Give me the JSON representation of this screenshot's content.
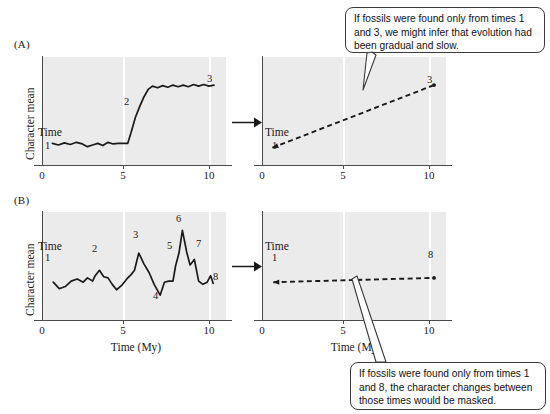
{
  "figure": {
    "panels": [
      {
        "letter": "(A)",
        "ylabel": "Character mean",
        "time_label": "Time",
        "left_chart": {
          "xticks": [
            "0",
            "5",
            "10"
          ],
          "point_labels": [
            "1",
            "2",
            "3"
          ]
        },
        "right_chart": {
          "xticks": [
            "0",
            "5",
            "10"
          ],
          "time_label": "Time",
          "point_labels": [
            "1",
            "3"
          ]
        },
        "callout": "If fossils were found only from times 1 and 3, we might infer that evolution had been gradual and slow."
      },
      {
        "letter": "(B)",
        "ylabel": "Character mean",
        "time_label": "Time",
        "xlabel": "Time (My)",
        "left_chart": {
          "xticks": [
            "0",
            "5",
            "10"
          ],
          "point_labels": [
            "1",
            "2",
            "3",
            "4",
            "5",
            "6",
            "7",
            "8"
          ]
        },
        "right_chart": {
          "xticks": [
            "0",
            "5",
            "10"
          ],
          "xlabel": "Time (My)",
          "time_label": "Time",
          "point_labels": [
            "1",
            "8"
          ]
        },
        "callout": "If fossils were found only from times 1 and 8, the character changes between those times would be masked."
      }
    ],
    "colors": {
      "plot_background": "#ebebeb",
      "gridline": "#ffffff",
      "axis": "#4a4a4a",
      "curve": "#1a1a1a",
      "callout_border": "#3a3a3a"
    }
  },
  "chart_data": [
    {
      "id": "A-left",
      "type": "line",
      "title": "",
      "xlabel": "",
      "ylabel": "Character mean",
      "xlim": [
        0,
        10.7
      ],
      "ylim": [
        0,
        10
      ],
      "xticks": [
        0,
        5,
        10
      ],
      "grid": "vertical-white-at-5-and-10",
      "description": "Punctuated equilibrium: long stasis, then a rapid shift near time 5, then renewed stasis.",
      "annotations": [
        {
          "label": "1",
          "x": 0.55,
          "y": 2.0
        },
        {
          "label": "2",
          "x": 5.45,
          "y": 5.6
        },
        {
          "label": "3",
          "x": 10.0,
          "y": 8.0
        }
      ],
      "x": [
        0.55,
        0.9,
        1.25,
        1.6,
        1.95,
        2.3,
        2.6,
        2.9,
        3.2,
        3.5,
        3.8,
        4.1,
        4.4,
        4.7,
        4.95,
        5.15,
        5.4,
        5.65,
        5.9,
        6.15,
        6.4,
        6.7,
        7.0,
        7.3,
        7.6,
        7.9,
        8.2,
        8.5,
        8.8,
        9.1,
        9.4,
        9.7,
        10.0
      ],
      "y": [
        2.0,
        1.85,
        2.05,
        1.9,
        2.1,
        1.95,
        1.7,
        1.85,
        2.0,
        1.8,
        2.1,
        1.95,
        2.0,
        2.0,
        2.0,
        3.0,
        4.4,
        5.4,
        6.3,
        7.0,
        7.3,
        7.15,
        7.35,
        7.2,
        7.4,
        7.25,
        7.4,
        7.25,
        7.45,
        7.3,
        7.45,
        7.3,
        7.4
      ]
    },
    {
      "id": "A-right",
      "type": "line",
      "linestyle": "dashed",
      "title": "",
      "xlabel": "",
      "ylabel": "",
      "xlim": [
        0,
        10.7
      ],
      "ylim": [
        0,
        10
      ],
      "xticks": [
        0,
        5,
        10
      ],
      "grid": "vertical-white-at-5-and-10",
      "description": "Inferred gradual change: straight dashed line from time 1 to time 3.",
      "annotations": [
        {
          "label": "1",
          "x": 0.55,
          "y": 1.6
        },
        {
          "label": "3",
          "x": 10.0,
          "y": 7.4
        }
      ],
      "x": [
        0.55,
        10.0
      ],
      "y": [
        1.6,
        7.4
      ]
    },
    {
      "id": "B-left",
      "type": "line",
      "title": "",
      "xlabel": "Time (My)",
      "ylabel": "Character mean",
      "xlim": [
        0,
        10.7
      ],
      "ylim": [
        0,
        10
      ],
      "xticks": [
        0,
        5,
        10
      ],
      "grid": "vertical-white-at-5-and-10",
      "description": "Fluctuating character mean with repeated rises and falls; eight sampled times marked.",
      "annotations": [
        {
          "label": "1",
          "x": 0.6,
          "y": 3.5
        },
        {
          "label": "2",
          "x": 3.3,
          "y": 4.6
        },
        {
          "label": "3",
          "x": 5.6,
          "y": 6.2
        },
        {
          "label": "4",
          "x": 6.85,
          "y": 2.3
        },
        {
          "label": "5",
          "x": 7.75,
          "y": 5.5
        },
        {
          "label": "6",
          "x": 8.15,
          "y": 8.3
        },
        {
          "label": "7",
          "x": 8.85,
          "y": 5.6
        },
        {
          "label": "8",
          "x": 9.95,
          "y": 3.4
        }
      ],
      "x": [
        0.6,
        0.95,
        1.3,
        1.65,
        2.0,
        2.35,
        2.6,
        2.9,
        3.05,
        3.3,
        3.55,
        3.8,
        4.05,
        4.3,
        4.6,
        4.9,
        5.15,
        5.35,
        5.6,
        5.9,
        6.2,
        6.5,
        6.85,
        7.1,
        7.35,
        7.6,
        7.75,
        7.95,
        8.15,
        8.4,
        8.6,
        8.85,
        9.1,
        9.35,
        9.6,
        9.8,
        9.95
      ],
      "y": [
        3.5,
        2.9,
        3.1,
        3.6,
        3.8,
        3.5,
        3.9,
        3.6,
        4.1,
        4.6,
        4.0,
        3.9,
        3.3,
        2.8,
        3.2,
        3.8,
        4.2,
        4.6,
        6.2,
        5.2,
        4.4,
        3.3,
        2.3,
        3.5,
        3.6,
        3.6,
        5.0,
        6.2,
        8.3,
        6.3,
        5.1,
        5.6,
        3.6,
        3.3,
        3.5,
        4.1,
        3.4
      ]
    },
    {
      "id": "B-right",
      "type": "line",
      "linestyle": "dashed",
      "title": "",
      "xlabel": "Time (My)",
      "ylabel": "",
      "xlim": [
        0,
        10.7
      ],
      "ylim": [
        0,
        10
      ],
      "xticks": [
        0,
        5,
        10
      ],
      "grid": "vertical-white-at-5-and-10",
      "description": "Inferred near-stasis: nearly flat dashed line from time 1 to time 8.",
      "annotations": [
        {
          "label": "1",
          "x": 0.6,
          "y": 3.5
        },
        {
          "label": "8",
          "x": 10.0,
          "y": 3.9
        }
      ],
      "x": [
        0.6,
        10.0
      ],
      "y": [
        3.5,
        3.9
      ]
    }
  ]
}
